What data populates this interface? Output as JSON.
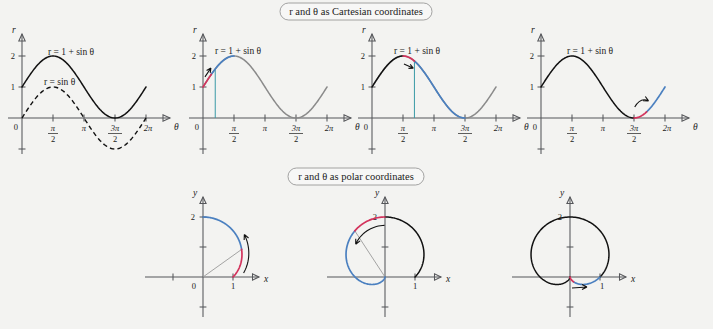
{
  "figure": {
    "title_top": "r and θ as Cartesian coordinates",
    "title_bottom": "r and θ as polar coordinates",
    "background_color": "#f3f3f1",
    "colors": {
      "black": "#111111",
      "gray": "#8a8a8a",
      "red": "#d3335c",
      "blue": "#4b80c0",
      "teal_drop": "#3a9aa6",
      "axis": "#55565a"
    }
  },
  "chart_data": [
    {
      "id": "cartesian-1",
      "type": "line",
      "title": "",
      "xlabel": "θ",
      "ylabel": "r",
      "xlim": [
        -0.55,
        7.3
      ],
      "ylim": [
        -1.35,
        2.45
      ],
      "xticks": [
        0,
        1.5707963,
        3.1415927,
        4.712389,
        6.2831853
      ],
      "xticklabels": [
        "0",
        "π/2",
        "π",
        "3π/2",
        "2π"
      ],
      "yticks": [
        1,
        2
      ],
      "yticklabels": [
        "1",
        "2"
      ],
      "grid": false,
      "annotations": [
        "r = 1 + sin θ",
        "r = sin θ"
      ],
      "series": [
        {
          "name": "r = 1 + sin θ",
          "style": "solid",
          "color": "#111111",
          "formula": "1+sin(t)",
          "t_start": 0,
          "t_end": 6.2831853
        },
        {
          "name": "r = sin θ",
          "style": "dashed",
          "color": "#111111",
          "formula": "sin(t)",
          "t_start": 0,
          "t_end": 6.2831853
        }
      ]
    },
    {
      "id": "cartesian-2",
      "type": "line",
      "xlabel": "θ",
      "ylabel": "r",
      "xlim": [
        -0.55,
        7.3
      ],
      "ylim": [
        -1.35,
        2.45
      ],
      "xticks": [
        0,
        1.5707963,
        3.1415927,
        4.712389,
        6.2831853
      ],
      "xticklabels": [
        "0",
        "π/2",
        "π",
        "3π/2",
        "2π"
      ],
      "yticks": [
        1,
        2
      ],
      "yticklabels": [
        "1",
        "2"
      ],
      "grid": false,
      "annotations": [
        "r = 1 + sin θ"
      ],
      "highlight_red": {
        "t_start": 0,
        "t_end": 0.42
      },
      "highlight_blue": {
        "t_start": 0.42,
        "t_end": 1.5707963
      },
      "remainder_color": "#8a8a8a",
      "drop_line_at": 0.62,
      "arrow": "up-right-at-start",
      "series": [
        {
          "name": "r = 1 + sin θ",
          "style": "solid",
          "formula": "1+sin(t)",
          "t_start": 0,
          "t_end": 6.2831853
        }
      ]
    },
    {
      "id": "cartesian-3",
      "type": "line",
      "xlabel": "θ",
      "ylabel": "r",
      "xlim": [
        -0.55,
        7.3
      ],
      "ylim": [
        -1.35,
        2.45
      ],
      "xticks": [
        0,
        1.5707963,
        3.1415927,
        4.712389,
        6.2831853
      ],
      "xticklabels": [
        "0",
        "π/2",
        "π",
        "3π/2",
        "2π"
      ],
      "yticks": [
        1,
        2
      ],
      "yticklabels": [
        "1",
        "2"
      ],
      "grid": false,
      "annotations": [
        "r = 1 + sin θ"
      ],
      "black_part": {
        "t_start": 0,
        "t_end": 1.5707963
      },
      "highlight_red": {
        "t_start": 1.5707963,
        "t_end": 2.15
      },
      "highlight_blue": {
        "t_start": 2.15,
        "t_end": 4.712389
      },
      "remainder_color": "#8a8a8a",
      "drop_line_at": 2.15,
      "arrow": "down-right-below-red",
      "series": [
        {
          "name": "r = 1 + sin θ",
          "style": "solid",
          "formula": "1+sin(t)",
          "t_start": 0,
          "t_end": 6.2831853
        }
      ]
    },
    {
      "id": "cartesian-4",
      "type": "line",
      "xlabel": "θ",
      "ylabel": "r",
      "xlim": [
        -0.55,
        7.3
      ],
      "ylim": [
        -1.35,
        2.45
      ],
      "xticks": [
        0,
        1.5707963,
        3.1415927,
        4.712389,
        6.2831853
      ],
      "xticklabels": [
        "0",
        "π/2",
        "π",
        "3π/2",
        "2π"
      ],
      "yticks": [
        1,
        2
      ],
      "yticklabels": [
        "1",
        "2"
      ],
      "grid": false,
      "annotations": [
        "r = 1 + sin θ"
      ],
      "black_part": {
        "t_start": 0,
        "t_end": 4.712389
      },
      "highlight_red": {
        "t_start": 4.712389,
        "t_end": 5.35
      },
      "highlight_blue": {
        "t_start": 5.35,
        "t_end": 6.2831853
      },
      "arrow": "curved-up-right",
      "series": [
        {
          "name": "r = 1 + sin θ",
          "style": "solid",
          "formula": "1+sin(t)",
          "t_start": 0,
          "t_end": 6.2831853
        }
      ]
    },
    {
      "id": "polar-1",
      "type": "line",
      "polar": true,
      "xlabel": "x",
      "ylabel": "y",
      "xticks": [
        -1,
        1
      ],
      "xticklabels": [
        "",
        "1"
      ],
      "yticks": [
        1,
        2
      ],
      "yticklabels": [
        "",
        "2"
      ],
      "origin_label": "0",
      "grid": false,
      "highlight_red": {
        "t_start": 0,
        "t_end": 0.62
      },
      "highlight_blue": {
        "t_start": 0.62,
        "t_end": 1.5707963
      },
      "ray_to": 0.62,
      "arrow": "ccw-small",
      "curve": "r = 1 + sin θ"
    },
    {
      "id": "polar-2",
      "type": "line",
      "polar": true,
      "xlabel": "x",
      "ylabel": "y",
      "xticks": [
        -1,
        1
      ],
      "xticklabels": [
        "",
        "1"
      ],
      "yticks": [
        1,
        2
      ],
      "yticklabels": [
        "",
        "2"
      ],
      "grid": false,
      "black_part": {
        "t_start": 0,
        "t_end": 1.5707963
      },
      "highlight_red": {
        "t_start": 1.5707963,
        "t_end": 2.15
      },
      "highlight_blue": {
        "t_start": 2.15,
        "t_end": 4.712389
      },
      "ray_to": 2.15,
      "arrow": "ccw-at-top",
      "curve": "r = 1 + sin θ"
    },
    {
      "id": "polar-3",
      "type": "line",
      "polar": true,
      "xlabel": "x",
      "ylabel": "y",
      "xticks": [
        -1,
        1
      ],
      "xticklabels": [
        "",
        "1"
      ],
      "yticks": [
        1,
        2
      ],
      "yticklabels": [
        "",
        "2"
      ],
      "grid": false,
      "black_part": {
        "t_start": 0,
        "t_end": 4.712389
      },
      "highlight_red": {
        "t_start": 4.712389,
        "t_end": 5.35
      },
      "highlight_blue": {
        "t_start": 5.35,
        "t_end": 6.2831853
      },
      "arrow": "right-at-cusp",
      "curve": "r = 1 + sin θ"
    }
  ],
  "labels": {
    "eq_cardioid": "r = 1 + sin θ",
    "eq_sine": "r = sin θ",
    "r": "r",
    "theta": "θ",
    "x": "x",
    "y": "y",
    "zero": "0",
    "one": "1",
    "two": "2",
    "pi": "π",
    "pi_over_2_num": "π",
    "pi_over_2_den": "2",
    "three_pi_over_2_num": "3π",
    "three_pi_over_2_den": "2",
    "two_pi": "2π"
  }
}
